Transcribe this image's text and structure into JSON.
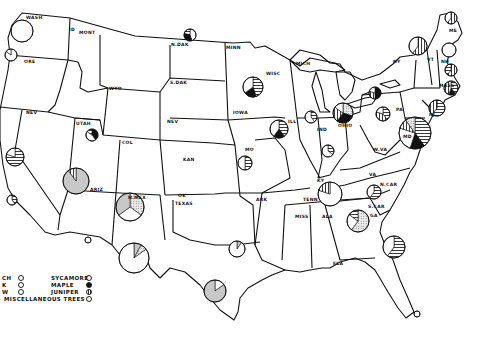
{
  "map": {
    "title": "",
    "state_labels": [
      {
        "id": "wash",
        "text": "WASH",
        "x": 26,
        "y": 16
      },
      {
        "id": "ore",
        "text": "ORE",
        "x": 24,
        "y": 60
      },
      {
        "id": "id",
        "text": "ID",
        "x": 69,
        "y": 28
      },
      {
        "id": "mont",
        "text": "MONT",
        "x": 79,
        "y": 31
      },
      {
        "id": "wyo",
        "text": "WYO",
        "x": 109,
        "y": 87
      },
      {
        "id": "nev",
        "text": "NEV",
        "x": 26,
        "y": 111
      },
      {
        "id": "utah",
        "text": "UTAH",
        "x": 76,
        "y": 122
      },
      {
        "id": "col",
        "text": "COL",
        "x": 122,
        "y": 141
      },
      {
        "id": "ariz",
        "text": "ARIZ",
        "x": 90,
        "y": 188
      },
      {
        "id": "nmex",
        "text": "N.MEX",
        "x": 128,
        "y": 196
      },
      {
        "id": "ndak",
        "text": "N.DAK",
        "x": 171,
        "y": 43
      },
      {
        "id": "sdak",
        "text": "S.DAK",
        "x": 170,
        "y": 81
      },
      {
        "id": "nebr",
        "text": "NEV",
        "x": 167,
        "y": 120
      },
      {
        "id": "kan",
        "text": "KAN",
        "x": 183,
        "y": 158
      },
      {
        "id": "okla",
        "text": "OK",
        "x": 178,
        "y": 194
      },
      {
        "id": "texas",
        "text": "TEXAS",
        "x": 175,
        "y": 202
      },
      {
        "id": "minn",
        "text": "MINN",
        "x": 226,
        "y": 46
      },
      {
        "id": "iowa",
        "text": "IOWA",
        "x": 233,
        "y": 111
      },
      {
        "id": "mo",
        "text": "MO",
        "x": 245,
        "y": 148
      },
      {
        "id": "ark",
        "text": "ARK",
        "x": 256,
        "y": 198
      },
      {
        "id": "wisc",
        "text": "WISC",
        "x": 266,
        "y": 72
      },
      {
        "id": "mich",
        "text": "MICH",
        "x": 296,
        "y": 62
      },
      {
        "id": "ill",
        "text": "ILL",
        "x": 288,
        "y": 120
      },
      {
        "id": "ind",
        "text": "IND",
        "x": 317,
        "y": 128
      },
      {
        "id": "ohio",
        "text": "OHIO",
        "x": 338,
        "y": 124
      },
      {
        "id": "ky",
        "text": "KY",
        "x": 317,
        "y": 179
      },
      {
        "id": "tenn",
        "text": "TENN",
        "x": 303,
        "y": 198
      },
      {
        "id": "miss",
        "text": "MISS",
        "x": 295,
        "y": 215
      },
      {
        "id": "ala",
        "text": "ALA",
        "x": 322,
        "y": 215
      },
      {
        "id": "ga",
        "text": "GA",
        "x": 370,
        "y": 214
      },
      {
        "id": "fla",
        "text": "FLA",
        "x": 333,
        "y": 262
      },
      {
        "id": "scar",
        "text": "S.CAR",
        "x": 368,
        "y": 205
      },
      {
        "id": "ncar",
        "text": "N.CAR",
        "x": 380,
        "y": 183
      },
      {
        "id": "va",
        "text": "VA",
        "x": 369,
        "y": 173
      },
      {
        "id": "wva",
        "text": "W.VA",
        "x": 373,
        "y": 148
      },
      {
        "id": "pa",
        "text": "PA",
        "x": 396,
        "y": 108
      },
      {
        "id": "ny",
        "text": "NY",
        "x": 393,
        "y": 60
      },
      {
        "id": "vt",
        "text": "VT",
        "x": 427,
        "y": 58
      },
      {
        "id": "nh",
        "text": "NH",
        "x": 441,
        "y": 60
      },
      {
        "id": "me",
        "text": "ME",
        "x": 449,
        "y": 29
      },
      {
        "id": "mass",
        "text": "MASS",
        "x": 439,
        "y": 84
      },
      {
        "id": "nj",
        "text": "NJ",
        "x": 429,
        "y": 113
      },
      {
        "id": "md",
        "text": "MD",
        "x": 403,
        "y": 135
      }
    ],
    "pie_charts": [
      {
        "state": "Washington",
        "cx": 22,
        "cy": 31,
        "r": 11,
        "slices": [
          {
            "pattern": "misc",
            "pct": 100
          }
        ]
      },
      {
        "state": "Oregon",
        "cx": 11,
        "cy": 55,
        "r": 6,
        "slices": [
          {
            "pattern": "misc",
            "pct": 85
          },
          {
            "pattern": "outline",
            "pct": 15
          }
        ]
      },
      {
        "state": "Nevada",
        "cx": 15,
        "cy": 157,
        "r": 9,
        "slices": [
          {
            "pattern": "hatch-h",
            "pct": 80
          },
          {
            "pattern": "misc",
            "pct": 20
          }
        ]
      },
      {
        "state": "California",
        "cx": 12,
        "cy": 200,
        "r": 5,
        "slices": [
          {
            "pattern": "hatch-h",
            "pct": 40
          },
          {
            "pattern": "misc",
            "pct": 60
          }
        ]
      },
      {
        "state": "Utah",
        "cx": 92,
        "cy": 135,
        "r": 6,
        "slices": [
          {
            "pattern": "solid-black",
            "pct": 40
          },
          {
            "pattern": "misc",
            "pct": 45
          },
          {
            "pattern": "hatch-h",
            "pct": 15
          }
        ]
      },
      {
        "state": "Arizona",
        "cx": 76,
        "cy": 181,
        "r": 13,
        "slices": [
          {
            "pattern": "gray",
            "pct": 90
          },
          {
            "pattern": "hatch-v",
            "pct": 10
          }
        ]
      },
      {
        "state": "New Mexico",
        "cx": 130,
        "cy": 207,
        "r": 14,
        "slices": [
          {
            "pattern": "dotted",
            "pct": 35
          },
          {
            "pattern": "misc",
            "pct": 30
          },
          {
            "pattern": "gray",
            "pct": 35
          }
        ]
      },
      {
        "state": "West Texas",
        "cx": 134,
        "cy": 258,
        "r": 15,
        "slices": [
          {
            "pattern": "gray",
            "pct": 8
          },
          {
            "pattern": "dotted",
            "pct": 7
          },
          {
            "pattern": "misc",
            "pct": 85
          }
        ]
      },
      {
        "state": "North Texas",
        "cx": 237,
        "cy": 249,
        "r": 8,
        "slices": [
          {
            "pattern": "gray",
            "pct": 10
          },
          {
            "pattern": "misc",
            "pct": 90
          }
        ]
      },
      {
        "state": "Central Texas",
        "cx": 215,
        "cy": 291,
        "r": 11,
        "slices": [
          {
            "pattern": "misc",
            "pct": 15
          },
          {
            "pattern": "gray",
            "pct": 85
          }
        ]
      },
      {
        "state": "New Mexico small",
        "cx": 88,
        "cy": 240,
        "r": 3,
        "slices": [
          {
            "pattern": "misc",
            "pct": 100
          }
        ]
      },
      {
        "state": "Minnesota",
        "cx": 190,
        "cy": 35,
        "r": 6,
        "slices": [
          {
            "pattern": "misc",
            "pct": 45
          },
          {
            "pattern": "solid-black",
            "pct": 35
          },
          {
            "pattern": "hatch-h",
            "pct": 20
          }
        ]
      },
      {
        "state": "Wisconsin",
        "cx": 253,
        "cy": 87,
        "r": 10,
        "slices": [
          {
            "pattern": "hatch-h",
            "pct": 45
          },
          {
            "pattern": "solid-black",
            "pct": 20
          },
          {
            "pattern": "misc",
            "pct": 35
          }
        ]
      },
      {
        "state": "Iowa",
        "cx": 279,
        "cy": 129,
        "r": 9,
        "slices": [
          {
            "pattern": "hatch-h",
            "pct": 40
          },
          {
            "pattern": "solid-black",
            "pct": 20
          },
          {
            "pattern": "misc",
            "pct": 40
          }
        ]
      },
      {
        "state": "Missouri",
        "cx": 245,
        "cy": 163,
        "r": 7,
        "slices": [
          {
            "pattern": "hatch-h",
            "pct": 50
          },
          {
            "pattern": "misc",
            "pct": 50
          }
        ]
      },
      {
        "state": "Illinois",
        "cx": 311,
        "cy": 117,
        "r": 6,
        "slices": [
          {
            "pattern": "hatch-h",
            "pct": 40
          },
          {
            "pattern": "misc",
            "pct": 60
          }
        ]
      },
      {
        "state": "Indiana",
        "cx": 328,
        "cy": 151,
        "r": 6,
        "slices": [
          {
            "pattern": "hatch-h",
            "pct": 35
          },
          {
            "pattern": "misc",
            "pct": 65
          }
        ]
      },
      {
        "state": "Ohio",
        "cx": 343,
        "cy": 113,
        "r": 10,
        "slices": [
          {
            "pattern": "dotted",
            "pct": 30
          },
          {
            "pattern": "solid-black",
            "pct": 30
          },
          {
            "pattern": "hatch-v",
            "pct": 25
          },
          {
            "pattern": "misc",
            "pct": 15
          }
        ]
      },
      {
        "state": "Michigan",
        "cx": 375,
        "cy": 93,
        "r": 6,
        "slices": [
          {
            "pattern": "solid-black",
            "pct": 50
          },
          {
            "pattern": "hatch-v",
            "pct": 30
          },
          {
            "pattern": "misc",
            "pct": 20
          }
        ]
      },
      {
        "state": "Pennsylvania",
        "cx": 383,
        "cy": 114,
        "r": 7,
        "slices": [
          {
            "pattern": "hatch-h",
            "pct": 40
          },
          {
            "pattern": "hatch-v",
            "pct": 40
          },
          {
            "pattern": "misc",
            "pct": 20
          }
        ]
      },
      {
        "state": "West Virginia",
        "cx": 415,
        "cy": 133,
        "r": 16,
        "slices": [
          {
            "pattern": "hatch-h",
            "pct": 40
          },
          {
            "pattern": "solid-black",
            "pct": 15
          },
          {
            "pattern": "misc",
            "pct": 25
          },
          {
            "pattern": "hatch-v",
            "pct": 10
          },
          {
            "pattern": "dotted",
            "pct": 10
          }
        ]
      },
      {
        "state": "New Jersey",
        "cx": 437,
        "cy": 108,
        "r": 8,
        "slices": [
          {
            "pattern": "hatch-h",
            "pct": 60
          },
          {
            "pattern": "hatch-v",
            "pct": 40
          }
        ]
      },
      {
        "state": "Kentucky",
        "cx": 330,
        "cy": 194,
        "r": 12,
        "slices": [
          {
            "pattern": "misc",
            "pct": 80
          },
          {
            "pattern": "hatch-v",
            "pct": 20
          }
        ]
      },
      {
        "state": "North Carolina",
        "cx": 374,
        "cy": 192,
        "r": 7,
        "slices": [
          {
            "pattern": "hatch-h",
            "pct": 60
          },
          {
            "pattern": "misc",
            "pct": 40
          }
        ]
      },
      {
        "state": "Georgia",
        "cx": 358,
        "cy": 221,
        "r": 11,
        "slices": [
          {
            "pattern": "dotted",
            "pct": 60
          },
          {
            "pattern": "misc",
            "pct": 25
          },
          {
            "pattern": "hatch-h",
            "pct": 15
          }
        ]
      },
      {
        "state": "Florida",
        "cx": 394,
        "cy": 247,
        "r": 11,
        "slices": [
          {
            "pattern": "hatch-h",
            "pct": 60
          },
          {
            "pattern": "misc",
            "pct": 40
          }
        ]
      },
      {
        "state": "New York",
        "cx": 418,
        "cy": 46,
        "r": 9,
        "slices": [
          {
            "pattern": "hatch-v",
            "pct": 60
          },
          {
            "pattern": "misc",
            "pct": 40
          }
        ]
      },
      {
        "state": "Maine",
        "cx": 451,
        "cy": 18,
        "r": 6,
        "slices": [
          {
            "pattern": "hatch-v",
            "pct": 60
          },
          {
            "pattern": "misc",
            "pct": 40
          }
        ]
      },
      {
        "state": "New Hampshire",
        "cx": 449,
        "cy": 50,
        "r": 7,
        "slices": [
          {
            "pattern": "misc",
            "pct": 100
          }
        ]
      },
      {
        "state": "Massachusetts",
        "cx": 451,
        "cy": 70,
        "r": 6,
        "slices": [
          {
            "pattern": "hatch-v",
            "pct": 60
          },
          {
            "pattern": "hatch-h",
            "pct": 40
          }
        ]
      },
      {
        "state": "Connecticut",
        "cx": 451,
        "cy": 88,
        "r": 7,
        "slices": [
          {
            "pattern": "hatch-h",
            "pct": 40
          },
          {
            "pattern": "solid-black",
            "pct": 15
          },
          {
            "pattern": "hatch-v",
            "pct": 45
          }
        ]
      },
      {
        "state": "South Florida",
        "cx": 417,
        "cy": 314,
        "r": 3,
        "slices": [
          {
            "pattern": "misc",
            "pct": 100
          }
        ]
      }
    ]
  },
  "legend": {
    "items_left": [
      {
        "label": "CH",
        "pattern": "hatch-v"
      },
      {
        "label": "K",
        "pattern": "hatch-h"
      },
      {
        "label": "W",
        "pattern": "misc"
      }
    ],
    "items_right": [
      {
        "label": "SYCAMORE",
        "pattern": "misc"
      },
      {
        "label": "MAPLE",
        "pattern": "solid-black"
      },
      {
        "label": "JUNIPER",
        "pattern": "hatch-v"
      }
    ],
    "misc_label": "MISCELLANEOUS TREES",
    "misc_pattern": "misc"
  },
  "colors": {
    "line": "#111111",
    "gray": "#c8c8c8",
    "black": "#111111",
    "background": "#ffffff"
  }
}
